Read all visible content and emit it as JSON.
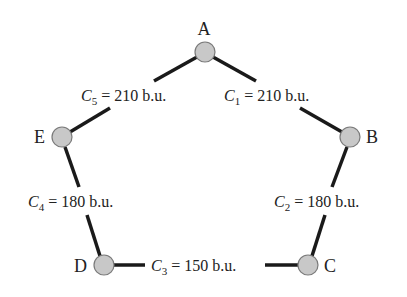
{
  "diagram": {
    "type": "network-graph",
    "colors": {
      "edge": "#1a1a1a",
      "node_fill": "#c8c8c8",
      "node_stroke": "#7a7a7a",
      "text": "#222222"
    },
    "nodes": [
      {
        "id": "A",
        "label": "A",
        "cx": 205,
        "cy": 52
      },
      {
        "id": "B",
        "label": "B",
        "cx": 350,
        "cy": 137
      },
      {
        "id": "C",
        "label": "C",
        "cx": 308,
        "cy": 265
      },
      {
        "id": "D",
        "label": "D",
        "cx": 104,
        "cy": 265
      },
      {
        "id": "E",
        "label": "E",
        "cx": 62,
        "cy": 137
      }
    ],
    "edges": [
      {
        "from": "A",
        "to": "B",
        "symbol": "C",
        "sub": "1",
        "rest": " = 210 b.u.",
        "cost": 210
      },
      {
        "from": "B",
        "to": "C",
        "symbol": "C",
        "sub": "2",
        "rest": " = 180 b.u.",
        "cost": 180
      },
      {
        "from": "C",
        "to": "D",
        "symbol": "C",
        "sub": "3",
        "rest": " = 150 b.u.",
        "cost": 150
      },
      {
        "from": "D",
        "to": "E",
        "symbol": "C",
        "sub": "4",
        "rest": " = 180 b.u.",
        "cost": 180
      },
      {
        "from": "E",
        "to": "A",
        "symbol": "C",
        "sub": "5",
        "rest": " = 210 b.u.",
        "cost": 210
      }
    ]
  }
}
